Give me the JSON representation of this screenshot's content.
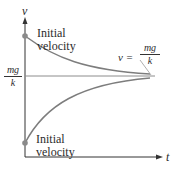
{
  "diagram": {
    "y_axis_label": "v",
    "x_axis_label": "t",
    "upper_curve_label": [
      "Initial",
      "velocity"
    ],
    "lower_curve_label": [
      "Initial",
      "velocity"
    ],
    "equilibrium_left": {
      "numerator": "mg",
      "denominator": "k"
    },
    "equilibrium_right": {
      "lhs": "v =",
      "numerator": "mg",
      "denominator": "k"
    },
    "colors": {
      "axis": "#333333",
      "curve": "#7d7d7d",
      "dot": "#8a8a8a",
      "asymptote": "#8c8c8c"
    }
  }
}
